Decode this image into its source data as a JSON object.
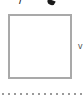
{
  "fragments": {
    "top_left_glyph": "/",
    "side_label": "v"
  },
  "checkbox": {
    "checked": false,
    "border_color": "#a9a9a9"
  },
  "separator": {
    "style": "dotted",
    "color": "#9a9a9a"
  }
}
